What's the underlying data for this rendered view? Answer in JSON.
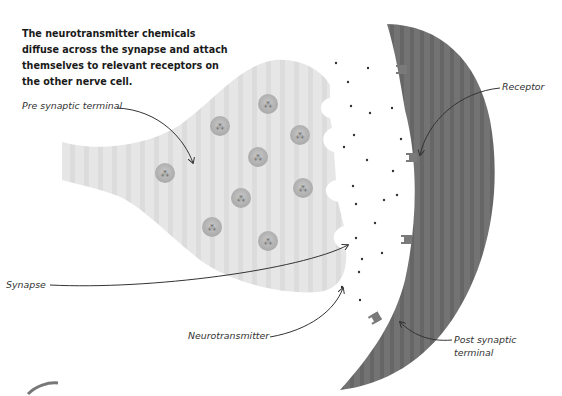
{
  "heading": {
    "line1": "The neurotransmitter chemicals",
    "line2": "diffuse across the synapse and attach",
    "line3": "themselves to relevant receptors on",
    "line4": "the other nerve cell."
  },
  "labels": {
    "pre_synaptic": "Pre synaptic terminal",
    "receptor": "Receptor",
    "synapse": "Synapse",
    "neurotransmitter": "Neurotransmitter",
    "post_synaptic_line1": "Post synaptic",
    "post_synaptic_line2": "terminal"
  },
  "colors": {
    "pre_terminal_fill": "#e4e4e4",
    "post_terminal_fill": "#6e6e6e",
    "vesicle_fill": "#b5b5b5",
    "dot": "#333333",
    "arrow": "#333333"
  }
}
